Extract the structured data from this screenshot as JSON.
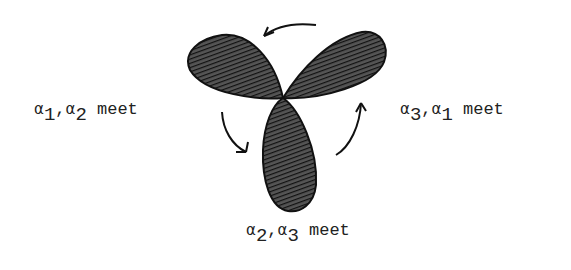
{
  "diagram": {
    "labels": [
      {
        "id": "left",
        "a": "α",
        "i": "1",
        "b": "α",
        "j": "2",
        "word": "meet"
      },
      {
        "id": "right",
        "a": "α",
        "i": "3",
        "b": "α",
        "j": "1",
        "word": "meet"
      },
      {
        "id": "bottom",
        "a": "α",
        "i": "2",
        "b": "α",
        "j": "3",
        "word": "meet"
      }
    ],
    "lobes": [
      "top-left",
      "top-right",
      "bottom"
    ],
    "arrows": [
      "top",
      "left",
      "right"
    ]
  }
}
